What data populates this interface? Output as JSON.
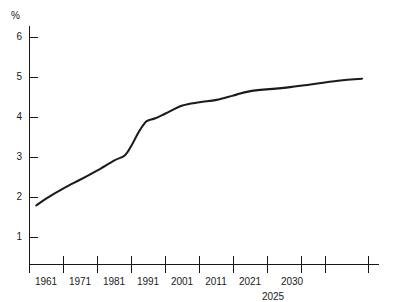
{
  "chart_data": {
    "type": "line",
    "title": "",
    "xlabel": "",
    "ylabel": "%",
    "ylim": [
      0.3,
      6.3
    ],
    "xlim": [
      1956,
      2035
    ],
    "grid": false,
    "legend": null,
    "y_ticks": [
      6,
      5,
      4,
      3,
      2,
      1
    ],
    "y_tick_labels": [
      "6",
      "5",
      "4",
      "3",
      "2",
      "1"
    ],
    "x_tick_labels": [
      "1961",
      "1971",
      "1981",
      "1991",
      "2001",
      "2011",
      "2021",
      "2030"
    ],
    "x_secondary_label": "2025",
    "series": [
      {
        "name": "percent",
        "x": [
          1958,
          1961,
          1966,
          1971,
          1976,
          1981,
          1984,
          1986,
          1988,
          1990,
          1991,
          1993,
          1996,
          2001,
          2006,
          2011,
          2016,
          2021,
          2025,
          2030,
          2033
        ],
        "values": [
          1.8,
          1.98,
          2.23,
          2.45,
          2.68,
          2.93,
          3.05,
          3.3,
          3.62,
          3.87,
          3.93,
          3.98,
          4.1,
          4.3,
          4.38,
          4.44,
          4.55,
          4.66,
          4.76,
          4.92,
          4.97
        ]
      }
    ]
  },
  "axis": {
    "unit_symbol": "%"
  }
}
